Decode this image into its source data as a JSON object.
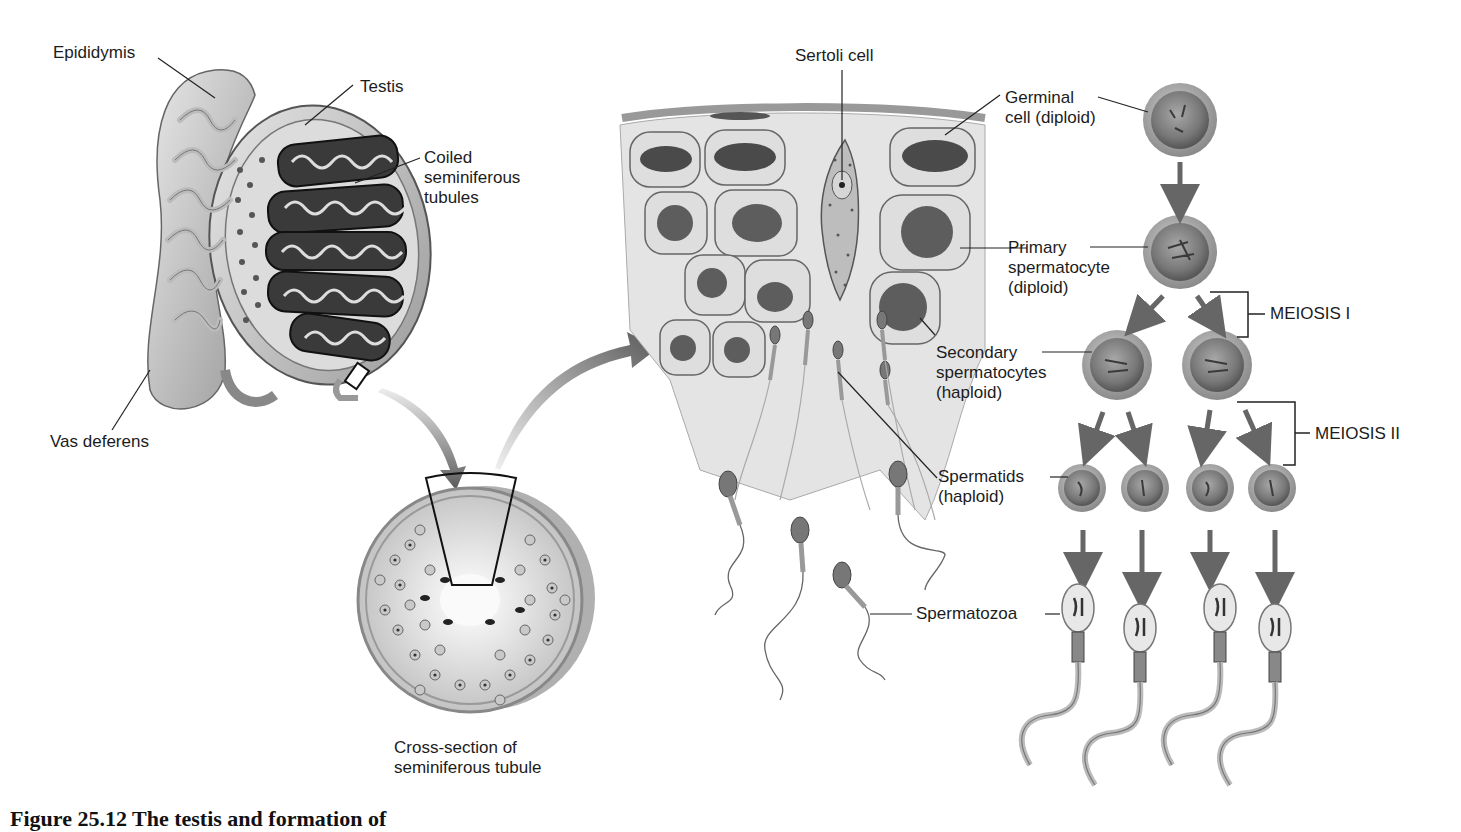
{
  "figure": {
    "caption": "Figure 25.12  The testis and formation of",
    "style": "grayscale"
  },
  "labels": {
    "epididymis": "Epididymis",
    "testis": "Testis",
    "coiled_tubules": [
      "Coiled",
      "seminiferous",
      "tubules"
    ],
    "vas_deferens": "Vas deferens",
    "cross_section": [
      "Cross-section of",
      "seminiferous tubule"
    ],
    "sertoli_cell": "Sertoli cell",
    "germinal_cell": [
      "Germinal",
      "cell (diploid)"
    ],
    "primary_spermatocyte": [
      "Primary",
      "spermatocyte",
      "(diploid)"
    ],
    "secondary_spermatocytes": [
      "Secondary",
      "spermatocytes",
      "(haploid)"
    ],
    "spermatids": [
      "Spermatids",
      "(haploid)"
    ],
    "spermatozoa": "Spermatozoa",
    "meiosis_1": "MEIOSIS I",
    "meiosis_2": "MEIOSIS II"
  },
  "colors": {
    "cell_fill": "#9a9a9a",
    "cell_ring": "#b5b5b5",
    "arrow": "#6a6a6a",
    "line": "#222222",
    "tissue": "#e2e2e2"
  }
}
